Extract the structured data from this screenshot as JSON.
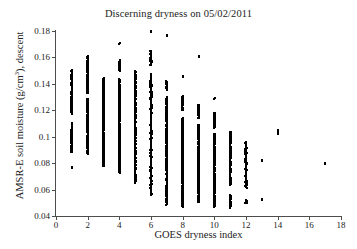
{
  "chart_data": {
    "type": "scatter",
    "title": "Discerning dryness on 05/02/2011",
    "xlabel": "GOES dryness index",
    "ylabel_plain": "AMSR-E soil moisture (g/cm3), descent",
    "ylabel_pre": "AMSR-E soil moisture (g/cm",
    "ylabel_sup": "3",
    "ylabel_post": "), descent",
    "xlim": [
      0,
      18
    ],
    "ylim": [
      0.04,
      0.18
    ],
    "xticks": [
      0,
      2,
      4,
      6,
      8,
      10,
      12,
      14,
      16,
      18
    ],
    "xtick_labels": [
      "0",
      "2",
      "4",
      "6",
      "8",
      "10",
      "12",
      "14",
      "16",
      "18"
    ],
    "yticks": [
      0.04,
      0.06,
      0.08,
      0.1,
      0.12,
      0.14,
      0.16,
      0.18
    ],
    "ytick_labels": [
      "0.04",
      "0.06",
      "0.08",
      "0.1",
      "0.12",
      "0.14",
      "0.16",
      "0.18"
    ],
    "grid": false,
    "legend": false,
    "marker": "square",
    "marker_color": "#000000",
    "marker_size_px": 2,
    "axes_style": "left-and-bottom-spines-only",
    "background_color": "#ffffff",
    "axis_color": "#4d4d4d",
    "columns": [
      {
        "x": 1,
        "y_min": 0.0885,
        "y_max": 0.1605,
        "outliers": [
          0.076
        ],
        "dense_ranges": [
          [
            0.0885,
            0.1105
          ],
          [
            0.117,
            0.1505
          ]
        ],
        "count": 240
      },
      {
        "x": 2,
        "y_min": 0.082,
        "y_max": 0.1665,
        "outliers": [],
        "dense_ranges": [
          [
            0.087,
            0.129
          ],
          [
            0.133,
            0.161
          ]
        ],
        "count": 300
      },
      {
        "x": 3,
        "y_min": 0.0775,
        "y_max": 0.163,
        "outliers": [],
        "dense_ranges": [
          [
            0.0775,
            0.1445
          ]
        ],
        "count": 330
      },
      {
        "x": 4,
        "y_min": 0.071,
        "y_max": 0.17,
        "outliers": [
          0.17
        ],
        "dense_ranges": [
          [
            0.0725,
            0.144
          ],
          [
            0.15,
            0.158
          ]
        ],
        "count": 340
      },
      {
        "x": 5,
        "y_min": 0.065,
        "y_max": 0.165,
        "outliers": [],
        "dense_ranges": [
          [
            0.065,
            0.15
          ]
        ],
        "count": 360
      },
      {
        "x": 6,
        "y_min": 0.0555,
        "y_max": 0.179,
        "outliers": [
          0.179
        ],
        "dense_ranges": [
          [
            0.0555,
            0.148
          ],
          [
            0.154,
            0.165
          ]
        ],
        "count": 370
      },
      {
        "x": 7,
        "y_min": 0.0485,
        "y_max": 0.176,
        "outliers": [
          0.176
        ],
        "dense_ranges": [
          [
            0.0485,
            0.13
          ],
          [
            0.1355,
            0.142
          ]
        ],
        "count": 370
      },
      {
        "x": 8,
        "y_min": 0.047,
        "y_max": 0.1455,
        "outliers": [
          0.1455
        ],
        "dense_ranges": [
          [
            0.047,
            0.114
          ],
          [
            0.12,
            0.131
          ]
        ],
        "count": 350
      },
      {
        "x": 9,
        "y_min": 0.0505,
        "y_max": 0.16,
        "outliers": [
          0.16
        ],
        "dense_ranges": [
          [
            0.0505,
            0.109
          ],
          [
            0.114,
            0.124
          ]
        ],
        "count": 300
      },
      {
        "x": 10,
        "y_min": 0.047,
        "y_max": 0.1285,
        "outliers": [
          0.1285
        ],
        "dense_ranges": [
          [
            0.047,
            0.1025
          ],
          [
            0.1065,
            0.118
          ]
        ],
        "count": 280
      },
      {
        "x": 11,
        "y_min": 0.046,
        "y_max": 0.104,
        "outliers": [],
        "dense_ranges": [
          [
            0.046,
            0.056
          ],
          [
            0.063,
            0.104
          ]
        ],
        "count": 190
      },
      {
        "x": 12,
        "y_min": 0.0495,
        "y_max": 0.096,
        "outliers": [],
        "dense_ranges": [
          [
            0.0495,
            0.0525
          ],
          [
            0.061,
            0.096
          ]
        ],
        "count": 110
      },
      {
        "x": 13,
        "y_min": 0.0518,
        "y_max": 0.0818,
        "outliers": [
          0.0518,
          0.0818
        ],
        "dense_ranges": [],
        "count": 2
      },
      {
        "x": 14,
        "y_min": 0.102,
        "y_max": 0.1042,
        "outliers": [
          0.102,
          0.1042
        ],
        "dense_ranges": [],
        "count": 3
      },
      {
        "x": 17,
        "y_min": 0.079,
        "y_max": 0.079,
        "outliers": [
          0.079
        ],
        "dense_ranges": [],
        "count": 1
      }
    ]
  }
}
